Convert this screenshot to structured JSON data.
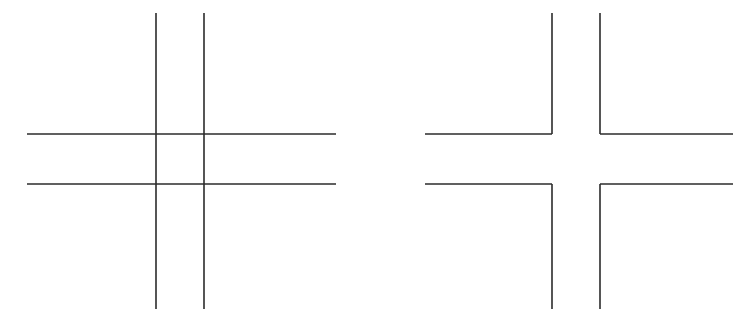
{
  "page": {
    "background_color": "#ffffff",
    "width": 746,
    "height": 324
  },
  "style": {
    "stroke_color": "#2b2b2b",
    "stroke_width": 1.6,
    "fill": "none"
  },
  "figures": [
    {
      "id": "left-figure",
      "name": "complete-crosshatch",
      "description": "Four full straight lines forming a hash / tic-tac-toe grid with a closed central square",
      "label": "",
      "bounds": {
        "x": 27,
        "y": 13,
        "width": 309,
        "height": 296
      },
      "grid": {
        "vertical_x": [
          156,
          204
        ],
        "horizontal_y": [
          134,
          184
        ],
        "vertical_top": 13,
        "vertical_bottom": 309,
        "horizontal_left": 27,
        "horizontal_right": 336
      },
      "segments": [
        {
          "name": "vertical-line-left",
          "x1": 156,
          "y1": 13,
          "x2": 156,
          "y2": 309
        },
        {
          "name": "vertical-line-right",
          "x1": 204,
          "y1": 13,
          "x2": 204,
          "y2": 309
        },
        {
          "name": "horizontal-line-top",
          "x1": 27,
          "y1": 134,
          "x2": 336,
          "y2": 134
        },
        {
          "name": "horizontal-line-bottom",
          "x1": 27,
          "y1": 184,
          "x2": 336,
          "y2": 184
        }
      ]
    },
    {
      "id": "right-figure",
      "name": "corner-crosshatch",
      "description": "Same hash grid with the central square outline removed, leaving four L-shaped corner brackets",
      "label": "",
      "bounds": {
        "x": 425,
        "y": 13,
        "width": 308,
        "height": 296
      },
      "grid": {
        "vertical_x": [
          552,
          600
        ],
        "horizontal_y": [
          134,
          184
        ],
        "vertical_top": 13,
        "vertical_bottom": 309,
        "horizontal_left": 425,
        "horizontal_right": 733
      },
      "segments": [
        {
          "name": "corner-top-left-vertical",
          "x1": 552,
          "y1": 13,
          "x2": 552,
          "y2": 134
        },
        {
          "name": "corner-top-left-horizontal",
          "x1": 425,
          "y1": 134,
          "x2": 552,
          "y2": 134
        },
        {
          "name": "corner-top-right-vertical",
          "x1": 600,
          "y1": 13,
          "x2": 600,
          "y2": 134
        },
        {
          "name": "corner-top-right-horizontal",
          "x1": 600,
          "y1": 134,
          "x2": 733,
          "y2": 134
        },
        {
          "name": "corner-bottom-left-horizontal",
          "x1": 425,
          "y1": 184,
          "x2": 552,
          "y2": 184
        },
        {
          "name": "corner-bottom-left-vertical",
          "x1": 552,
          "y1": 184,
          "x2": 552,
          "y2": 309
        },
        {
          "name": "corner-bottom-right-horizontal",
          "x1": 600,
          "y1": 184,
          "x2": 733,
          "y2": 184
        },
        {
          "name": "corner-bottom-right-vertical",
          "x1": 600,
          "y1": 184,
          "x2": 600,
          "y2": 309
        }
      ]
    }
  ]
}
